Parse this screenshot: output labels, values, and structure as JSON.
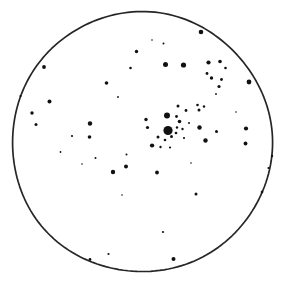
{
  "figure": {
    "kind": "astronomical-sketch",
    "background_color": "#ffffff",
    "ink_color": "#1a1a1a"
  },
  "field_of_view": {
    "shape": "circle",
    "center_x": 141.5,
    "center_y": 142.0,
    "radius": 130.0,
    "stroke_color": "#262626",
    "stroke_width": 1.7,
    "fill": "none"
  },
  "chart_data": {
    "type": "scatter",
    "xlabel": "",
    "ylabel": "",
    "xlim": [
      0,
      283
    ],
    "ylim": [
      283,
      0
    ],
    "grid": false,
    "legend": null,
    "point_color": "#111111",
    "note": "Hand-drawn eyepiece sketch. Each point is one star; r is the drawn dot radius in pixels, a proxy for apparent brightness (larger dot = brighter star).",
    "series": [
      {
        "name": "stars",
        "points": [
          {
            "x": 168.0,
            "y": 130.5,
            "r": 4.6
          },
          {
            "x": 167.0,
            "y": 115.5,
            "r": 3.0
          },
          {
            "x": 152.0,
            "y": 145.5,
            "r": 2.1
          },
          {
            "x": 158.0,
            "y": 137.0,
            "r": 1.5
          },
          {
            "x": 146.0,
            "y": 119.5,
            "r": 1.7
          },
          {
            "x": 147.5,
            "y": 127.5,
            "r": 1.6
          },
          {
            "x": 176.5,
            "y": 116.5,
            "r": 1.4
          },
          {
            "x": 179.5,
            "y": 121.5,
            "r": 1.8
          },
          {
            "x": 177.0,
            "y": 127.5,
            "r": 1.2
          },
          {
            "x": 182.5,
            "y": 129.0,
            "r": 1.2
          },
          {
            "x": 176.0,
            "y": 133.0,
            "r": 1.3
          },
          {
            "x": 171.5,
            "y": 136.5,
            "r": 1.5
          },
          {
            "x": 165.0,
            "y": 140.0,
            "r": 1.3
          },
          {
            "x": 160.5,
            "y": 147.0,
            "r": 1.2
          },
          {
            "x": 170.0,
            "y": 147.5,
            "r": 1.1
          },
          {
            "x": 184.0,
            "y": 138.0,
            "r": 1.1
          },
          {
            "x": 189.0,
            "y": 123.0,
            "r": 1.0
          },
          {
            "x": 186.0,
            "y": 110.5,
            "r": 1.4
          },
          {
            "x": 178.0,
            "y": 106.0,
            "r": 1.5
          },
          {
            "x": 199.0,
            "y": 110.0,
            "r": 1.5
          },
          {
            "x": 197.5,
            "y": 105.0,
            "r": 1.3
          },
          {
            "x": 204.0,
            "y": 106.5,
            "r": 1.2
          },
          {
            "x": 199.5,
            "y": 127.5,
            "r": 2.2
          },
          {
            "x": 216.5,
            "y": 131.5,
            "r": 1.5
          },
          {
            "x": 205.5,
            "y": 140.5,
            "r": 2.2
          },
          {
            "x": 246.0,
            "y": 128.5,
            "r": 2.1
          },
          {
            "x": 245.5,
            "y": 143.5,
            "r": 1.9
          },
          {
            "x": 249.0,
            "y": 82.0,
            "r": 2.4
          },
          {
            "x": 220.0,
            "y": 61.5,
            "r": 1.8
          },
          {
            "x": 208.5,
            "y": 62.5,
            "r": 2.1
          },
          {
            "x": 225.5,
            "y": 68.0,
            "r": 1.3
          },
          {
            "x": 207.0,
            "y": 73.5,
            "r": 1.4
          },
          {
            "x": 211.5,
            "y": 78.0,
            "r": 1.7
          },
          {
            "x": 221.5,
            "y": 79.5,
            "r": 1.4
          },
          {
            "x": 219.0,
            "y": 86.5,
            "r": 1.6
          },
          {
            "x": 201.0,
            "y": 32.0,
            "r": 2.3
          },
          {
            "x": 183.5,
            "y": 65.0,
            "r": 2.6
          },
          {
            "x": 163.5,
            "y": 43.5,
            "r": 1.0
          },
          {
            "x": 165.5,
            "y": 64.5,
            "r": 2.5
          },
          {
            "x": 136.5,
            "y": 51.5,
            "r": 1.7
          },
          {
            "x": 130.5,
            "y": 68.0,
            "r": 1.3
          },
          {
            "x": 106.5,
            "y": 83.0,
            "r": 1.8
          },
          {
            "x": 44.0,
            "y": 67.0,
            "r": 1.9
          },
          {
            "x": 20.5,
            "y": 96.0,
            "r": 1.1
          },
          {
            "x": 49.5,
            "y": 101.5,
            "r": 2.0
          },
          {
            "x": 32.0,
            "y": 113.0,
            "r": 1.7
          },
          {
            "x": 36.0,
            "y": 124.5,
            "r": 1.5
          },
          {
            "x": 90.0,
            "y": 123.5,
            "r": 2.2
          },
          {
            "x": 72.0,
            "y": 136.0,
            "r": 1.1
          },
          {
            "x": 89.5,
            "y": 137.0,
            "r": 1.8
          },
          {
            "x": 95.5,
            "y": 158.0,
            "r": 1.0
          },
          {
            "x": 126.5,
            "y": 154.5,
            "r": 1.0
          },
          {
            "x": 113.0,
            "y": 172.0,
            "r": 2.2
          },
          {
            "x": 126.0,
            "y": 166.5,
            "r": 2.0
          },
          {
            "x": 157.0,
            "y": 172.5,
            "r": 1.9
          },
          {
            "x": 153.0,
            "y": 145.5,
            "r": 1.2
          },
          {
            "x": 196.0,
            "y": 194.0,
            "r": 1.5
          },
          {
            "x": 163.0,
            "y": 232.0,
            "r": 1.1
          },
          {
            "x": 173.5,
            "y": 259.0,
            "r": 2.0
          },
          {
            "x": 108.5,
            "y": 254.0,
            "r": 1.1
          },
          {
            "x": 90.0,
            "y": 259.5,
            "r": 1.4
          },
          {
            "x": 272.0,
            "y": 156.0,
            "r": 1.2
          },
          {
            "x": 268.5,
            "y": 168.0,
            "r": 1.1
          },
          {
            "x": 262.0,
            "y": 192.0,
            "r": 1.3
          },
          {
            "x": 60.5,
            "y": 152.0,
            "r": 0.9
          },
          {
            "x": 82.0,
            "y": 164.0,
            "r": 0.8
          },
          {
            "x": 118.0,
            "y": 97.0,
            "r": 0.9
          },
          {
            "x": 152.0,
            "y": 40.0,
            "r": 0.8
          },
          {
            "x": 216.0,
            "y": 94.0,
            "r": 0.9
          },
          {
            "x": 236.0,
            "y": 112.0,
            "r": 0.8
          },
          {
            "x": 122.0,
            "y": 195.0,
            "r": 0.8
          },
          {
            "x": 191.0,
            "y": 163.0,
            "r": 0.8
          }
        ]
      }
    ]
  }
}
